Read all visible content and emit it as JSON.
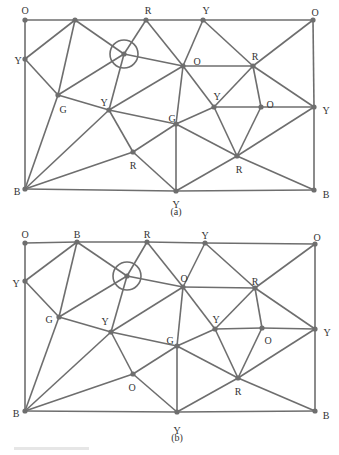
{
  "figures": [
    {
      "id": "a",
      "caption": "(a)",
      "caption_pos": [
        176,
        215
      ],
      "nodes": [
        {
          "id": "n0",
          "label": "O",
          "x": 25,
          "y": 20,
          "lx": 25,
          "ly": 12,
          "anchor": "middle"
        },
        {
          "id": "n1",
          "label": "",
          "x": 75,
          "y": 20,
          "lx": 75,
          "ly": 12,
          "anchor": "middle"
        },
        {
          "id": "n2",
          "label": "R",
          "x": 146,
          "y": 20,
          "lx": 148,
          "ly": 12,
          "anchor": "middle"
        },
        {
          "id": "n3",
          "label": "Y",
          "x": 203,
          "y": 20,
          "lx": 206,
          "ly": 12,
          "anchor": "middle"
        },
        {
          "id": "n4",
          "label": "O",
          "x": 313,
          "y": 20,
          "lx": 315,
          "ly": 14,
          "anchor": "middle"
        },
        {
          "id": "n5",
          "label": "Y",
          "x": 25,
          "y": 59,
          "lx": 18,
          "ly": 62,
          "anchor": "middle"
        },
        {
          "id": "n6",
          "label": "",
          "x": 124,
          "y": 54,
          "lx": 124,
          "ly": 54,
          "anchor": "middle"
        },
        {
          "id": "n7",
          "label": "O",
          "x": 183,
          "y": 66,
          "lx": 197,
          "ly": 63,
          "anchor": "middle"
        },
        {
          "id": "n8",
          "label": "R",
          "x": 253,
          "y": 66,
          "lx": 255,
          "ly": 58,
          "anchor": "middle"
        },
        {
          "id": "n9",
          "label": "G",
          "x": 58,
          "y": 95,
          "lx": 63,
          "ly": 111,
          "anchor": "middle"
        },
        {
          "id": "n10",
          "label": "Y",
          "x": 109,
          "y": 110,
          "lx": 104,
          "ly": 104,
          "anchor": "middle"
        },
        {
          "id": "n11",
          "label": "Y",
          "x": 214,
          "y": 107,
          "lx": 217,
          "ly": 98,
          "anchor": "middle"
        },
        {
          "id": "n12",
          "label": "O",
          "x": 261,
          "y": 107,
          "lx": 270,
          "ly": 106,
          "anchor": "middle"
        },
        {
          "id": "n13",
          "label": "Y",
          "x": 314,
          "y": 107,
          "lx": 326,
          "ly": 112,
          "anchor": "middle"
        },
        {
          "id": "n14",
          "label": "G",
          "x": 176,
          "y": 124,
          "lx": 172,
          "ly": 120,
          "anchor": "middle"
        },
        {
          "id": "n15",
          "label": "R",
          "x": 133,
          "y": 152,
          "lx": 133,
          "ly": 167,
          "anchor": "middle"
        },
        {
          "id": "n16",
          "label": "R",
          "x": 237,
          "y": 156,
          "lx": 239,
          "ly": 171,
          "anchor": "middle"
        },
        {
          "id": "n17",
          "label": "B",
          "x": 25,
          "y": 189,
          "lx": 17,
          "ly": 193,
          "anchor": "middle"
        },
        {
          "id": "n18",
          "label": "Y",
          "x": 176,
          "y": 191,
          "lx": 176,
          "ly": 206,
          "anchor": "middle"
        },
        {
          "id": "n19",
          "label": "B",
          "x": 314,
          "y": 190,
          "lx": 326,
          "ly": 196,
          "anchor": "middle"
        }
      ],
      "highlight": {
        "node": "n6",
        "radius": 14
      },
      "edges": [
        [
          "n0",
          "n1"
        ],
        [
          "n1",
          "n2"
        ],
        [
          "n2",
          "n3"
        ],
        [
          "n3",
          "n4"
        ],
        [
          "n0",
          "n5"
        ],
        [
          "n5",
          "n17"
        ],
        [
          "n4",
          "n13"
        ],
        [
          "n13",
          "n19"
        ],
        [
          "n17",
          "n18"
        ],
        [
          "n18",
          "n19"
        ],
        [
          "n1",
          "n5"
        ],
        [
          "n5",
          "n9"
        ],
        [
          "n1",
          "n9"
        ],
        [
          "n1",
          "n6"
        ],
        [
          "n2",
          "n6"
        ],
        [
          "n2",
          "n7"
        ],
        [
          "n6",
          "n7"
        ],
        [
          "n6",
          "n9"
        ],
        [
          "n6",
          "n10"
        ],
        [
          "n3",
          "n7"
        ],
        [
          "n3",
          "n8"
        ],
        [
          "n4",
          "n8"
        ],
        [
          "n7",
          "n8"
        ],
        [
          "n9",
          "n10"
        ],
        [
          "n9",
          "n17"
        ],
        [
          "n10",
          "n17"
        ],
        [
          "n10",
          "n7"
        ],
        [
          "n10",
          "n14"
        ],
        [
          "n10",
          "n15"
        ],
        [
          "n7",
          "n14"
        ],
        [
          "n7",
          "n11"
        ],
        [
          "n8",
          "n11"
        ],
        [
          "n8",
          "n12"
        ],
        [
          "n8",
          "n13"
        ],
        [
          "n11",
          "n12"
        ],
        [
          "n12",
          "n13"
        ],
        [
          "n11",
          "n14"
        ],
        [
          "n11",
          "n16"
        ],
        [
          "n12",
          "n16"
        ],
        [
          "n13",
          "n16"
        ],
        [
          "n14",
          "n15"
        ],
        [
          "n14",
          "n16"
        ],
        [
          "n14",
          "n18"
        ],
        [
          "n15",
          "n17"
        ],
        [
          "n15",
          "n18"
        ],
        [
          "n16",
          "n18"
        ],
        [
          "n16",
          "n19"
        ]
      ]
    },
    {
      "id": "b",
      "caption": "(b)",
      "caption_pos": [
        177,
        441
      ],
      "nodes": [
        {
          "id": "n0",
          "label": "O",
          "x": 25,
          "y": 243,
          "lx": 25,
          "ly": 236,
          "anchor": "middle"
        },
        {
          "id": "n1",
          "label": "B",
          "x": 77,
          "y": 242,
          "lx": 77,
          "ly": 236,
          "anchor": "middle"
        },
        {
          "id": "n2",
          "label": "R",
          "x": 147,
          "y": 242,
          "lx": 147,
          "ly": 236,
          "anchor": "middle"
        },
        {
          "id": "n3",
          "label": "Y",
          "x": 205,
          "y": 243,
          "lx": 205,
          "ly": 237,
          "anchor": "middle"
        },
        {
          "id": "n4",
          "label": "O",
          "x": 315,
          "y": 244,
          "lx": 317,
          "ly": 239,
          "anchor": "middle"
        },
        {
          "id": "n5",
          "label": "Y",
          "x": 25,
          "y": 281,
          "lx": 16,
          "ly": 285,
          "anchor": "middle"
        },
        {
          "id": "n6",
          "label": "",
          "x": 127,
          "y": 276,
          "lx": 127,
          "ly": 276,
          "anchor": "middle"
        },
        {
          "id": "n7",
          "label": "O",
          "x": 183,
          "y": 287,
          "lx": 184,
          "ly": 280,
          "anchor": "middle"
        },
        {
          "id": "n8",
          "label": "R",
          "x": 255,
          "y": 288,
          "lx": 255,
          "ly": 283,
          "anchor": "middle"
        },
        {
          "id": "n9",
          "label": "G",
          "x": 59,
          "y": 317,
          "lx": 49,
          "ly": 321,
          "anchor": "middle"
        },
        {
          "id": "n10",
          "label": "Y",
          "x": 111,
          "y": 332,
          "lx": 105,
          "ly": 323,
          "anchor": "middle"
        },
        {
          "id": "n11",
          "label": "Y",
          "x": 215,
          "y": 329,
          "lx": 216,
          "ly": 321,
          "anchor": "middle"
        },
        {
          "id": "n12",
          "label": "O",
          "x": 262,
          "y": 328,
          "lx": 268,
          "ly": 342,
          "anchor": "middle"
        },
        {
          "id": "n13",
          "label": "Y",
          "x": 315,
          "y": 329,
          "lx": 327,
          "ly": 334,
          "anchor": "middle"
        },
        {
          "id": "n14",
          "label": "G",
          "x": 177,
          "y": 346,
          "lx": 170,
          "ly": 342,
          "anchor": "middle"
        },
        {
          "id": "n15",
          "label": "O",
          "x": 133,
          "y": 374,
          "lx": 132,
          "ly": 389,
          "anchor": "middle"
        },
        {
          "id": "n16",
          "label": "R",
          "x": 238,
          "y": 378,
          "lx": 238,
          "ly": 393,
          "anchor": "middle"
        },
        {
          "id": "n17",
          "label": "B",
          "x": 25,
          "y": 411,
          "lx": 16,
          "ly": 415,
          "anchor": "middle"
        },
        {
          "id": "n18",
          "label": "Y",
          "x": 177,
          "y": 412,
          "lx": 177,
          "ly": 432,
          "anchor": "middle"
        },
        {
          "id": "n19",
          "label": "B",
          "x": 315,
          "y": 411,
          "lx": 326,
          "ly": 417,
          "anchor": "middle"
        }
      ],
      "highlight": {
        "node": "n6",
        "radius": 14
      },
      "edges": [
        [
          "n0",
          "n1"
        ],
        [
          "n1",
          "n2"
        ],
        [
          "n2",
          "n3"
        ],
        [
          "n3",
          "n4"
        ],
        [
          "n0",
          "n5"
        ],
        [
          "n5",
          "n17"
        ],
        [
          "n4",
          "n13"
        ],
        [
          "n13",
          "n19"
        ],
        [
          "n17",
          "n18"
        ],
        [
          "n18",
          "n19"
        ],
        [
          "n1",
          "n5"
        ],
        [
          "n5",
          "n9"
        ],
        [
          "n1",
          "n9"
        ],
        [
          "n1",
          "n6"
        ],
        [
          "n2",
          "n6"
        ],
        [
          "n2",
          "n7"
        ],
        [
          "n6",
          "n7"
        ],
        [
          "n6",
          "n9"
        ],
        [
          "n6",
          "n10"
        ],
        [
          "n3",
          "n7"
        ],
        [
          "n3",
          "n8"
        ],
        [
          "n4",
          "n8"
        ],
        [
          "n7",
          "n8"
        ],
        [
          "n9",
          "n10"
        ],
        [
          "n9",
          "n17"
        ],
        [
          "n10",
          "n17"
        ],
        [
          "n10",
          "n7"
        ],
        [
          "n10",
          "n14"
        ],
        [
          "n10",
          "n15"
        ],
        [
          "n7",
          "n14"
        ],
        [
          "n7",
          "n11"
        ],
        [
          "n8",
          "n11"
        ],
        [
          "n8",
          "n12"
        ],
        [
          "n8",
          "n13"
        ],
        [
          "n11",
          "n12"
        ],
        [
          "n12",
          "n13"
        ],
        [
          "n11",
          "n14"
        ],
        [
          "n11",
          "n16"
        ],
        [
          "n12",
          "n16"
        ],
        [
          "n13",
          "n16"
        ],
        [
          "n14",
          "n15"
        ],
        [
          "n14",
          "n16"
        ],
        [
          "n14",
          "n18"
        ],
        [
          "n15",
          "n17"
        ],
        [
          "n15",
          "n18"
        ],
        [
          "n16",
          "n18"
        ],
        [
          "n16",
          "n19"
        ]
      ]
    }
  ],
  "style": {
    "line_color": "#6e6e6e",
    "label_color": "#333333",
    "background": "#ffffff"
  }
}
